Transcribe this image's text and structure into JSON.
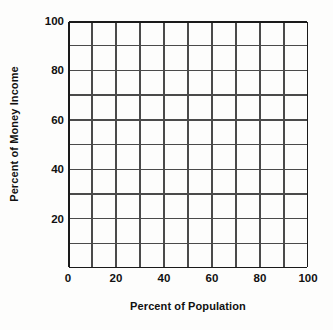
{
  "chart_data": {
    "type": "line",
    "title": "",
    "subtitle": "",
    "xlabel": "Percent of Population",
    "ylabel": "Percent of Money Income",
    "xlim": [
      0,
      100
    ],
    "ylim": [
      0,
      100
    ],
    "x_ticks_major": [
      0,
      20,
      40,
      60,
      80,
      100
    ],
    "x_ticks_minor": [
      10,
      30,
      50,
      70,
      90
    ],
    "y_ticks_major": [
      20,
      40,
      60,
      80,
      100
    ],
    "y_ticks_minor": [
      10,
      30,
      50,
      70,
      90
    ],
    "x_tick_labels": [
      "0",
      "20",
      "40",
      "60",
      "80",
      "100"
    ],
    "y_tick_labels": [
      "20",
      "40",
      "60",
      "80",
      "100"
    ],
    "grid": true,
    "grid_columns": 10,
    "grid_rows": 10,
    "legend": null,
    "series": [],
    "annotations": []
  },
  "axes": {
    "y_title": "Percent of Money Income",
    "x_title": "Percent of Population"
  },
  "colors": {
    "background": "#fdfdfc",
    "grid_line": "#4a4a4a",
    "axis_line": "#1a1a1a",
    "text": "#111111"
  }
}
